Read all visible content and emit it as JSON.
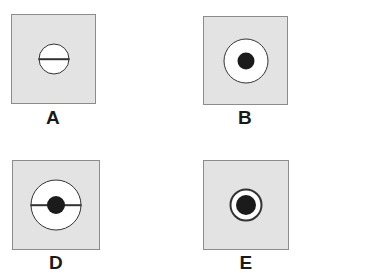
{
  "figure": {
    "background_color": "#ffffff",
    "swatch_fill": "#e3e3e3",
    "swatch_border": "#8c8c8c",
    "outline_color": "#333333",
    "dot_color": "#1b1b1b",
    "panels": [
      {
        "label": "A",
        "x": 11,
        "y": 14,
        "width": 85,
        "height": 90,
        "label_x": 53,
        "label_y": 108,
        "label_size": 19,
        "circle_diameter": 31,
        "circle_stroke": 1,
        "has_diameter_line": true,
        "line_length": 31,
        "line_thickness": 1.6,
        "has_center_dot": false,
        "dot_diameter": 0,
        "description": "light gray square containing a white circle bisected by a horizontal diameter line"
      },
      {
        "label": "B",
        "x": 203,
        "y": 16,
        "width": 85,
        "height": 89,
        "label_x": 245,
        "label_y": 108,
        "label_size": 19,
        "circle_diameter": 45,
        "circle_stroke": 1.6,
        "has_diameter_line": false,
        "line_length": 0,
        "line_thickness": 0,
        "has_center_dot": true,
        "dot_diameter": 17,
        "description": "light gray square containing a white circle with a solid black dot at its center"
      },
      {
        "label": "D",
        "x": 12,
        "y": 160,
        "width": 88,
        "height": 90,
        "label_x": 56,
        "label_y": 253,
        "label_size": 19,
        "circle_diameter": 51,
        "circle_stroke": 1.6,
        "has_diameter_line": true,
        "line_length": 51,
        "line_thickness": 1.6,
        "has_center_dot": true,
        "dot_diameter": 18,
        "description": "light gray square containing a white circle with a horizontal diameter line and a solid black center dot"
      },
      {
        "label": "E",
        "x": 203,
        "y": 160,
        "width": 86,
        "height": 90,
        "label_x": 246,
        "label_y": 253,
        "label_size": 19,
        "circle_diameter": 33,
        "circle_stroke": 2.4,
        "has_diameter_line": false,
        "line_length": 0,
        "line_thickness": 0,
        "has_center_dot": true,
        "dot_diameter": 20,
        "description": "light gray square containing a small white circle with a thick black outline and a large solid black center dot"
      }
    ]
  }
}
